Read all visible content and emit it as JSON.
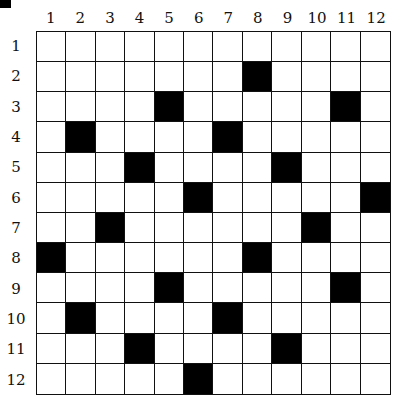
{
  "grid": {
    "rows": 12,
    "cols": 12,
    "column_labels": [
      "1",
      "2",
      "3",
      "4",
      "5",
      "6",
      "7",
      "8",
      "9",
      "10",
      "11",
      "12"
    ],
    "row_labels": [
      "1",
      "2",
      "3",
      "4",
      "5",
      "6",
      "7",
      "8",
      "9",
      "10",
      "11",
      "12"
    ],
    "black_cells": [
      [
        2,
        8
      ],
      [
        3,
        5
      ],
      [
        3,
        11
      ],
      [
        4,
        2
      ],
      [
        4,
        7
      ],
      [
        5,
        4
      ],
      [
        5,
        9
      ],
      [
        6,
        6
      ],
      [
        6,
        12
      ],
      [
        7,
        3
      ],
      [
        7,
        10
      ],
      [
        8,
        1
      ],
      [
        8,
        8
      ],
      [
        9,
        5
      ],
      [
        9,
        11
      ],
      [
        10,
        2
      ],
      [
        10,
        7
      ],
      [
        11,
        4
      ],
      [
        11,
        9
      ],
      [
        12,
        6
      ]
    ],
    "colors": {
      "filled": "#000000",
      "empty": "#ffffff",
      "line": "#111111"
    }
  }
}
